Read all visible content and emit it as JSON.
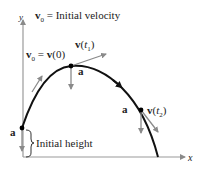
{
  "diagram": {
    "title_label": {
      "v": "v",
      "sub": "0",
      "rest": " = Initial velocity"
    },
    "initial_velocity_label": {
      "v": "v",
      "sub": "0",
      "eq": " = ",
      "v2": "v",
      "arg": "(0)"
    },
    "velocity_t1_label": {
      "v": "v",
      "open": "(",
      "t": "t",
      "sub": "1",
      "close": ")"
    },
    "velocity_t2_label": {
      "v": "v",
      "open": "(",
      "t": "t",
      "sub": "2",
      "close": ")"
    },
    "acceleration_label": "a",
    "initial_height_label": "Initial height",
    "axis_x_label": "x",
    "axis_y_label": "y",
    "colors": {
      "curve": "#111111",
      "vectors": "#8a8a8a",
      "axes": "#9a9a9a",
      "points": "#000000",
      "text": "#222222"
    }
  }
}
